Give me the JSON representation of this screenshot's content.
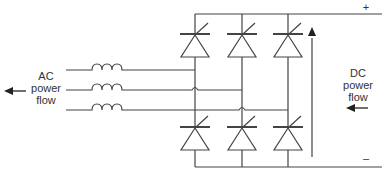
{
  "diagram": {
    "ac_label": [
      "AC",
      "power",
      "flow"
    ],
    "dc_label": [
      "DC",
      "power",
      "flow"
    ],
    "dc_plus": "+",
    "dc_minus": "–",
    "colors": {
      "line": "#444444",
      "text": "#333333"
    }
  }
}
